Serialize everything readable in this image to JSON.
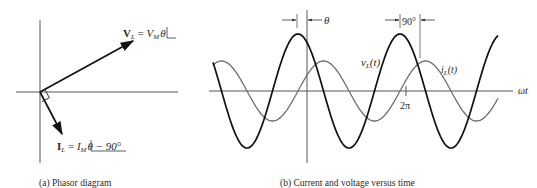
{
  "panel_a": {
    "caption": "(a) Phasor diagram",
    "origin": [
      40,
      92
    ],
    "v_phasor": {
      "label_main": "V",
      "label_sub": "L",
      "eq": " = ",
      "mag": "V",
      "mag_sub": "M",
      "angle": "θ",
      "tip": [
        133,
        41
      ]
    },
    "i_phasor": {
      "label_main": "I",
      "label_sub": "L",
      "eq": " = ",
      "mag": "I",
      "mag_sub": "M",
      "angle": "θ − 90°",
      "tip": [
        62,
        134
      ]
    }
  },
  "panel_b": {
    "caption": "(b) Current and voltage versus time",
    "theta_label": "θ",
    "phase_label": "90°",
    "v_label_main": "v",
    "v_label_sub": "L",
    "v_label_arg": "(t)",
    "i_label_main": "i",
    "i_label_sub": "L",
    "i_label_arg": "(t)",
    "tick_label": "2π",
    "axis_label": "ωt",
    "colors": {
      "voltage": "#111111",
      "current": "#6e6e6e",
      "axis": "#555555"
    },
    "waveform": {
      "axis_y": 91,
      "x_start": 213,
      "x_end": 498,
      "period_px": 102,
      "v_peak_x": 298,
      "v_amp": 57,
      "i_peak_x": 323.5,
      "i_amp": 30
    }
  }
}
